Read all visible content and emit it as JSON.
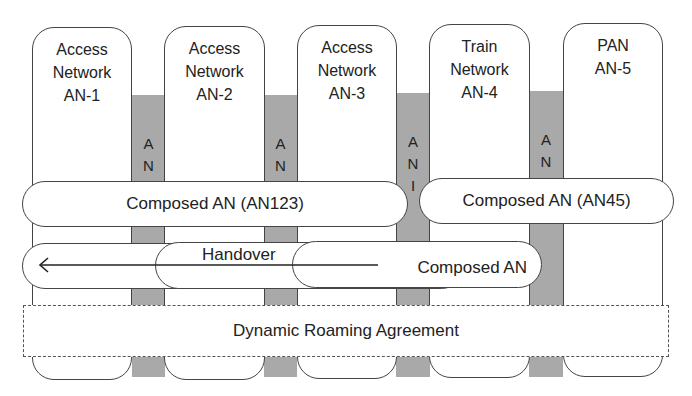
{
  "networks": [
    {
      "label": "Access\nNetwork\nAN-1"
    },
    {
      "label": "Access\nNetwork\nAN-2"
    },
    {
      "label": "Access\nNetwork\nAN-3"
    },
    {
      "label": "Train\nNetwork\nAN-4"
    },
    {
      "label": "PAN\nAN-5"
    }
  ],
  "ani": {
    "label": "A\nN\nI"
  },
  "composed": {
    "an123": "Composed AN (AN123)",
    "an45": "Composed AN (AN45)",
    "moving": "Composed AN"
  },
  "handover": {
    "label": "Handover",
    "arrow": "left-arrow"
  },
  "roaming": {
    "label": "Dynamic Roaming Agreement"
  }
}
